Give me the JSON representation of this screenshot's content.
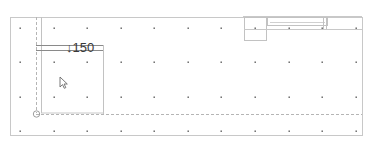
{
  "canvas": {
    "width": 370,
    "height": 144,
    "background": "#ffffff",
    "line_color": "#bdbdbd",
    "dark_line_color": "#8a8a8a",
    "dot_color": "#555555"
  },
  "grid": {
    "x": [
      20,
      54,
      87,
      121,
      154,
      188,
      221,
      255,
      289,
      322,
      356
    ],
    "y": [
      28,
      62,
      97,
      131
    ]
  },
  "level_marker": {
    "symbol": "↓",
    "value": "150",
    "text": "↓150"
  }
}
